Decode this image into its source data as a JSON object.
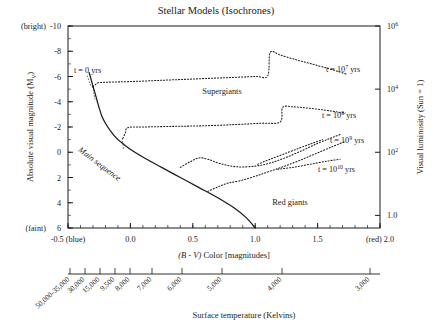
{
  "chart_data": {
    "type": "line",
    "title": "Stellar Models (Isochrones)",
    "xlabel_parts": {
      "italic": "(B - V)",
      "rest": " Color [magnitudes]"
    },
    "xlabel": "(B - V) Color [magnitudes]",
    "ylabel_parts": {
      "text": "Absolute visual magnitude (M",
      "sub": "V",
      "close": ")"
    },
    "ylabel": "Absolute visual magnitude (M_V)",
    "ylabel_right": "Visual luminosity (Sun = 1)",
    "xlabel_secondary": "Surface temperature (Kelvins)",
    "xlim": [
      -0.5,
      2.0
    ],
    "ylim": [
      6,
      -10
    ],
    "y_inverted": true,
    "grid": false,
    "legend": "inline-annotations",
    "x_ticks": [
      {
        "value": -0.5,
        "label": "-0.5 (blue)"
      },
      {
        "value": 0.0,
        "label": "0.0"
      },
      {
        "value": 0.5,
        "label": "0.5"
      },
      {
        "value": 1.0,
        "label": "1.0"
      },
      {
        "value": 1.5,
        "label": "1.5"
      },
      {
        "value": 2.0,
        "label": "(red) 2.0"
      }
    ],
    "x_minor_step": 0.1,
    "y_ticks": [
      {
        "value": -10,
        "label": "-10",
        "edge": "(bright)"
      },
      {
        "value": -8,
        "label": "-8"
      },
      {
        "value": -6,
        "label": "-6"
      },
      {
        "value": -4,
        "label": "-4"
      },
      {
        "value": -2,
        "label": "-2"
      },
      {
        "value": 0,
        "label": "0"
      },
      {
        "value": 2,
        "label": "2"
      },
      {
        "value": 4,
        "label": "4"
      },
      {
        "value": 6,
        "label": "6",
        "edge": "(faint)"
      }
    ],
    "y_edge_labels": {
      "top": "(bright)",
      "bottom": "(faint)"
    },
    "y_ticks_right": [
      {
        "mag": -10,
        "mantissa": "10",
        "exp": "6"
      },
      {
        "mag": -5,
        "mantissa": "10",
        "exp": "4"
      },
      {
        "mag": 0,
        "mantissa": "10",
        "exp": "2"
      },
      {
        "mag": 5,
        "mantissa": "1.0",
        "exp": ""
      }
    ],
    "temperature_ticks": [
      {
        "label": "50,000-35,000",
        "x": 70
      },
      {
        "label": "30,000",
        "x": 85
      },
      {
        "label": "15,000",
        "x": 100
      },
      {
        "label": "9,500",
        "x": 115
      },
      {
        "label": "8,000",
        "x": 130
      },
      {
        "label": "7,000",
        "x": 152
      },
      {
        "label": "6,000",
        "x": 182
      },
      {
        "label": "5,000",
        "x": 222
      },
      {
        "label": "4,000",
        "x": 282
      },
      {
        "label": "3,000",
        "x": 370
      }
    ],
    "region_labels": [
      {
        "name": "supergiants",
        "text": "Supergiants",
        "x": 222,
        "y": 94
      },
      {
        "name": "red-giants",
        "text": "Red giants",
        "x": 290,
        "y": 205
      },
      {
        "name": "main-sequence",
        "text": "Main sequence",
        "x": 98,
        "y": 166,
        "rotate": 37,
        "italic": true
      }
    ],
    "isochrone_annotations": [
      {
        "name": "t-0",
        "text": "t = 0 yrs",
        "base": "t = 0 yrs",
        "exp": "",
        "x": 74,
        "y": 73
      },
      {
        "name": "t-1e7",
        "base": "t = 10",
        "exp": "7",
        "tail": " yrs",
        "x": 326,
        "y": 72
      },
      {
        "name": "t-1e8",
        "base": "t = 10",
        "exp": "8",
        "tail": " yrs",
        "x": 322,
        "y": 118
      },
      {
        "name": "t-1e9",
        "base": "t = 10",
        "exp": "9",
        "tail": " yrs",
        "x": 330,
        "y": 143
      },
      {
        "name": "t-1e10",
        "base": "t = 10",
        "exp": "10",
        "tail": " yrs",
        "x": 318,
        "y": 172
      }
    ],
    "series": [
      {
        "name": "main-sequence",
        "label": "t = 0 yrs",
        "style": "solid",
        "points": [
          [
            -0.33,
            -6.3
          ],
          [
            -0.31,
            -5.6
          ],
          [
            -0.29,
            -4.9
          ],
          [
            -0.27,
            -4.2
          ],
          [
            -0.25,
            -3.5
          ],
          [
            -0.23,
            -2.9
          ],
          [
            -0.2,
            -2.3
          ],
          [
            -0.16,
            -1.7
          ],
          [
            -0.11,
            -1.1
          ],
          [
            -0.05,
            -0.6
          ],
          [
            0.02,
            -0.1
          ],
          [
            0.12,
            0.5
          ],
          [
            0.25,
            1.2
          ],
          [
            0.4,
            2.0
          ],
          [
            0.55,
            2.8
          ],
          [
            0.7,
            3.6
          ],
          [
            0.83,
            4.4
          ],
          [
            0.93,
            5.2
          ],
          [
            1.0,
            6.0
          ]
        ]
      },
      {
        "name": "isochrone-1e7",
        "label": "t = 10^7 yrs",
        "style": "dotted",
        "points": [
          [
            -0.3,
            -5.2
          ],
          [
            -0.28,
            -5.35
          ],
          [
            -0.26,
            -5.5
          ],
          [
            -0.18,
            -5.55
          ],
          [
            0.0,
            -5.6
          ],
          [
            0.25,
            -5.7
          ],
          [
            0.5,
            -5.8
          ],
          [
            0.75,
            -5.9
          ],
          [
            1.0,
            -6.0
          ],
          [
            1.1,
            -6.05
          ],
          [
            1.12,
            -7.9
          ],
          [
            1.2,
            -7.7
          ],
          [
            1.32,
            -7.35
          ],
          [
            1.45,
            -7.0
          ],
          [
            1.58,
            -6.65
          ],
          [
            1.68,
            -6.35
          ],
          [
            1.74,
            -6.15
          ]
        ]
      },
      {
        "name": "isochrone-1e8",
        "label": "t = 10^8 yrs",
        "style": "dotted",
        "points": [
          [
            -0.06,
            -1.1
          ],
          [
            -0.04,
            -1.55
          ],
          [
            -0.02,
            -1.95
          ],
          [
            0.1,
            -2.0
          ],
          [
            0.35,
            -2.05
          ],
          [
            0.6,
            -2.1
          ],
          [
            0.85,
            -2.2
          ],
          [
            1.05,
            -2.3
          ],
          [
            1.2,
            -2.4
          ],
          [
            1.22,
            -3.55
          ],
          [
            1.3,
            -3.6
          ],
          [
            1.42,
            -3.5
          ],
          [
            1.55,
            -3.35
          ],
          [
            1.65,
            -3.2
          ],
          [
            1.72,
            -3.1
          ]
        ]
      },
      {
        "name": "isochrone-1e9",
        "label": "t = 10^9 yrs",
        "style": "dotted",
        "points": [
          [
            0.4,
            1.2
          ],
          [
            0.48,
            0.75
          ],
          [
            0.55,
            0.45
          ],
          [
            0.62,
            0.55
          ],
          [
            0.72,
            0.9
          ],
          [
            0.85,
            1.15
          ],
          [
            1.0,
            1.1
          ],
          [
            1.12,
            0.85
          ],
          [
            1.25,
            0.4
          ],
          [
            1.38,
            -0.15
          ],
          [
            1.5,
            -0.7
          ],
          [
            1.6,
            -1.1
          ],
          [
            1.68,
            -1.4
          ]
        ]
      },
      {
        "name": "isochrone-1e10",
        "label": "t = 10^10 yrs",
        "style": "dotted",
        "points": [
          [
            0.62,
            3.1
          ],
          [
            0.7,
            2.75
          ],
          [
            0.78,
            2.45
          ],
          [
            0.88,
            2.25
          ],
          [
            1.0,
            1.9
          ],
          [
            1.12,
            1.5
          ],
          [
            1.25,
            1.05
          ],
          [
            1.38,
            0.55
          ],
          [
            1.5,
            0.05
          ],
          [
            1.62,
            -0.45
          ],
          [
            1.72,
            -0.85
          ]
        ]
      },
      {
        "name": "isochrone-1e9-upper-branch",
        "label": "t = 10^9 upper",
        "style": "dotted",
        "points": [
          [
            1.02,
            0.95
          ],
          [
            1.12,
            0.55
          ],
          [
            1.24,
            0.1
          ],
          [
            1.36,
            -0.35
          ],
          [
            1.46,
            -0.72
          ],
          [
            1.54,
            -1.0
          ]
        ]
      },
      {
        "name": "isochrone-1e10-upper-branch",
        "label": "t = 10^10 upper",
        "style": "dotted",
        "points": [
          [
            1.18,
            1.35
          ],
          [
            1.3,
            1.2
          ],
          [
            1.44,
            0.95
          ],
          [
            1.58,
            0.7
          ],
          [
            1.68,
            0.55
          ]
        ]
      }
    ],
    "connector_segments": [
      {
        "name": "ms-to-1e7-connector",
        "points": [
          [
            -0.345,
            -6.05
          ],
          [
            -0.315,
            -5.25
          ],
          [
            -0.3,
            -5.2
          ]
        ]
      },
      {
        "name": "kink-1e7",
        "points": [
          [
            -0.3,
            -5.2
          ],
          [
            -0.285,
            -4.2
          ]
        ]
      },
      {
        "name": "kink-1e8",
        "points": [
          [
            -0.065,
            -1.1
          ],
          [
            -0.055,
            -0.25
          ]
        ]
      }
    ]
  }
}
